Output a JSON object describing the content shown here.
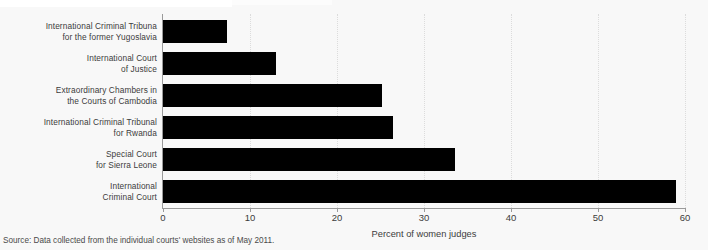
{
  "chart_data": {
    "type": "bar",
    "orientation": "horizontal",
    "title": "",
    "xlabel": "Percent of women judges",
    "ylabel": "",
    "xlim": [
      0,
      60
    ],
    "xticks": [
      0,
      10,
      20,
      30,
      40,
      50,
      60
    ],
    "grid": "vertical-dotted",
    "legend": "none",
    "bar_color": "#000000",
    "categories": [
      "International Criminal Tribuna\nfor the former Yugoslavia",
      "International Court\nof Justice",
      "Extraordinary Chambers in\nthe Courts of Cambodia",
      "International Criminal Tribunal\nfor Rwanda",
      "Special Court\nfor Sierra Leone",
      "International\nCriminal Court"
    ],
    "values": [
      7.4,
      13.0,
      25.2,
      26.4,
      33.6,
      59.0
    ],
    "bars": [
      {
        "label_line1": "International Criminal Tribuna",
        "label_line2": "for the former Yugoslavia",
        "value": 7.4
      },
      {
        "label_line1": "International Court",
        "label_line2": "of Justice",
        "value": 13.0
      },
      {
        "label_line1": "Extraordinary Chambers in",
        "label_line2": "the Courts of Cambodia",
        "value": 25.2
      },
      {
        "label_line1": "International Criminal Tribunal",
        "label_line2": "for Rwanda",
        "value": 26.4
      },
      {
        "label_line1": "Special Court",
        "label_line2": "for Sierra Leone",
        "value": 33.6
      },
      {
        "label_line1": "International",
        "label_line2": "Criminal Court",
        "value": 59.0
      }
    ]
  },
  "axis": {
    "tick_labels": [
      "0",
      "10",
      "20",
      "30",
      "40",
      "50",
      "60"
    ],
    "x_title": "Percent of women judges"
  },
  "footer": {
    "source": "Source: Data collected from the individual courts' websites as of May 2011."
  }
}
